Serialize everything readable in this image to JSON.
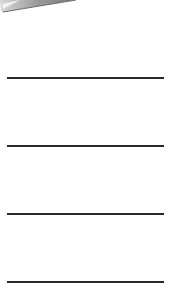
{
  "document": {
    "decoration": {
      "icon": "folded-page-corner-icon",
      "color": "#8a8a8a"
    },
    "ruled_lines": [
      {
        "y": 77
      },
      {
        "y": 145
      },
      {
        "y": 213
      },
      {
        "y": 281
      }
    ],
    "line_color": "#2a2a2a"
  }
}
